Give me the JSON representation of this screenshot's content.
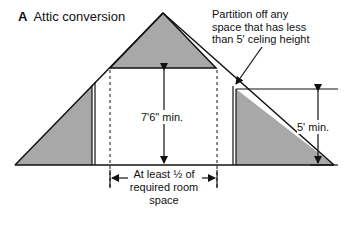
{
  "figure": {
    "panel_letter": "A",
    "title": "Attic conversion"
  },
  "annotations": {
    "partition_note_line1": "Partition off any",
    "partition_note_line2": "space that has less",
    "partition_note_line3": "than 5' celing height",
    "ceiling_height": "7'6\" min.",
    "knee_wall_height": "5' min.",
    "width_line1": "At least ½ of",
    "width_line2": "required room",
    "width_line3": "space"
  },
  "colors": {
    "shaded_area": "#a8a8a8",
    "line": "#111111",
    "background": "#ffffff"
  }
}
